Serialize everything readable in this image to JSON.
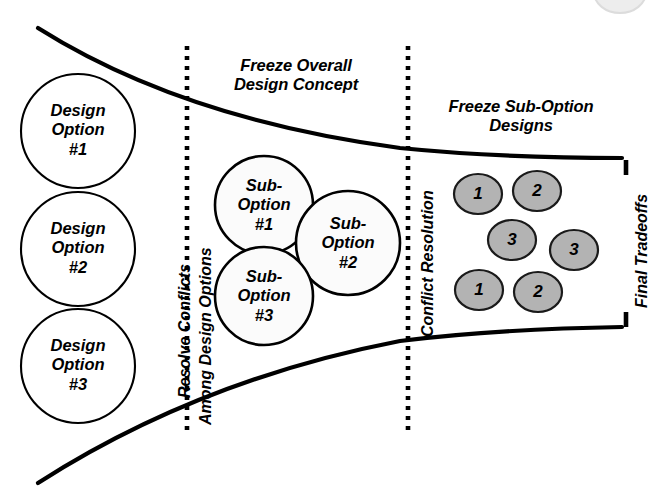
{
  "diagram": {
    "background_color": "#ffffff",
    "stroke_color": "#000000",
    "grey_fill": "#b3b3b3"
  },
  "phase_headings": [
    {
      "id": "concept",
      "text": "Freeze Overall\nDesign Concept"
    },
    {
      "id": "subopt",
      "text": "Freeze Sub-Option\nDesigns"
    }
  ],
  "dividers": [
    {
      "id": "resolve",
      "style": "dotted",
      "labels": [
        "Resolve Conflicts",
        "Among Design Options"
      ]
    },
    {
      "id": "conflict",
      "style": "dotted",
      "labels": [
        "Conflict Resolution"
      ]
    },
    {
      "id": "final",
      "style": "solid-broken",
      "labels": [
        "Final Tradeoffs"
      ]
    }
  ],
  "design_options": [
    {
      "text": "Design\nOption\n#1"
    },
    {
      "text": "Design\nOption\n#2"
    },
    {
      "text": "Design\nOption\n#3"
    }
  ],
  "sub_options": [
    {
      "text": "Sub-\nOption\n#1"
    },
    {
      "text": "Sub-\nOption\n#2"
    },
    {
      "text": "Sub-\nOption\n#3"
    }
  ],
  "final_items": [
    {
      "label": "1"
    },
    {
      "label": "2"
    },
    {
      "label": "3"
    },
    {
      "label": "3"
    },
    {
      "label": "1"
    },
    {
      "label": "2"
    }
  ]
}
